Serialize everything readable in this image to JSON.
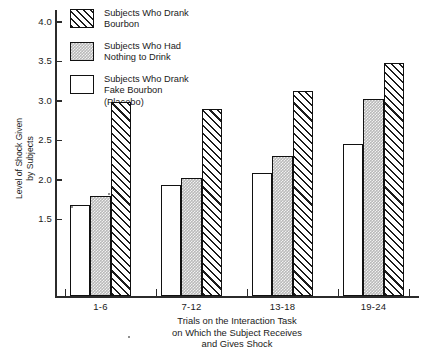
{
  "chart_data": {
    "type": "bar",
    "title": "",
    "subtitle": "",
    "xlabel": "Trials on the Interaction Task on Which the Subject Receives and Gives Shock",
    "ylabel": "Level of Shock Given by Subjects",
    "categories": [
      "1-6",
      "7-12",
      "13-18",
      "19-24"
    ],
    "series": [
      {
        "name": "Subjects Who Drank Fake Bourbon (Placebo)",
        "key": "placebo",
        "pattern": "open-white",
        "values": [
          1.68,
          1.94,
          2.09,
          2.45
        ]
      },
      {
        "name": "Subjects Who Had Nothing to Drink",
        "key": "nothing",
        "pattern": "gray-stipple",
        "values": [
          1.8,
          2.02,
          2.3,
          3.02
        ]
      },
      {
        "name": "Subjects Who Drank Bourbon",
        "key": "bourbon",
        "pattern": "diagonal-hatch",
        "values": [
          2.98,
          2.9,
          3.13,
          3.48
        ]
      }
    ],
    "ylim": [
      0.53,
      4.15
    ],
    "yticks": [
      1.5,
      2.0,
      2.5,
      3.0,
      3.5,
      4.0
    ],
    "ytick_labels": [
      "1.5",
      "2.0",
      "2.5",
      "3.0",
      "3.5",
      "4.0"
    ],
    "grid": false,
    "legend_position": "top-left",
    "colors": {
      "axis": "#2b2b2b",
      "bar_outline": "#111111",
      "placebo_fill": "#ffffff",
      "nothing_fill": "#b9b9b9",
      "bourbon_hatch": "#1c1c1c",
      "background": "#ffffff"
    }
  },
  "axes": {
    "y_title_lines": [
      "Level of Shock Given",
      "by Subjects"
    ],
    "x_title_lines": [
      "Trials on the Interaction Task",
      "on Which the Subject Receives",
      "and Gives Shock"
    ]
  },
  "legend": {
    "items": [
      {
        "swatch": "bourbon",
        "lines": [
          "Subjects Who Drank",
          "Bourbon"
        ]
      },
      {
        "swatch": "nothing",
        "lines": [
          "Subjects Who Had",
          "Nothing to Drink"
        ]
      },
      {
        "swatch": "placebo",
        "lines": [
          "Subjects Who Drank",
          "Fake Bourbon",
          "(Placebo)"
        ]
      }
    ]
  }
}
